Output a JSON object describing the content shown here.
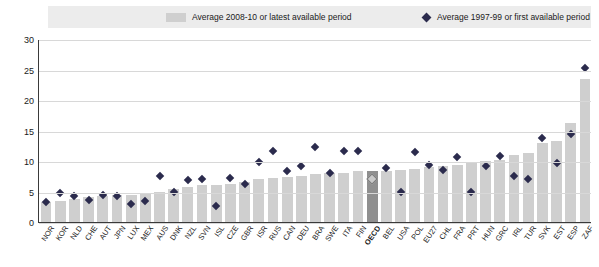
{
  "legend": {
    "bar_label": "Average 2008-10 or latest available period",
    "marker_label": "Average 1997-99 or first available period",
    "bar_color": "#cfcfcf",
    "marker_color": "#2b2b4d"
  },
  "chart_data": {
    "type": "bar",
    "title": "",
    "subtitle": "",
    "xlabel": "",
    "ylabel": "",
    "ylim": [
      0,
      30
    ],
    "yticks": [
      0,
      5,
      10,
      15,
      20,
      25,
      30
    ],
    "grid": true,
    "legend_position": "top",
    "highlight_category": "OECD",
    "categories": [
      "NOR",
      "KOR",
      "NLD",
      "CHE",
      "AUT",
      "JPN",
      "LUX",
      "MEX",
      "AUS",
      "DNK",
      "NZL",
      "SVN",
      "ISL",
      "CZE",
      "GBR",
      "ISR",
      "RUS",
      "CAN",
      "DEU",
      "BRA",
      "SWE",
      "ITA",
      "FIN",
      "OECD",
      "BEL",
      "USA",
      "POL",
      "EU27",
      "CHL",
      "FRA",
      "PRT",
      "HUN",
      "GRC",
      "IRL",
      "TUR",
      "SVK",
      "EST",
      "ESP",
      "ZAF"
    ],
    "series": [
      {
        "name": "Average 2008-10 or latest available period",
        "type": "bar",
        "color": "#cfcfcf",
        "values": [
          3.3,
          3.5,
          3.8,
          4.1,
          4.3,
          4.5,
          4.5,
          4.8,
          5.0,
          5.4,
          5.8,
          6.0,
          6.1,
          6.3,
          6.5,
          7.0,
          7.2,
          7.4,
          7.6,
          7.8,
          8.0,
          8.1,
          8.3,
          8.4,
          8.4,
          8.6,
          8.7,
          9.0,
          9.2,
          9.3,
          9.8,
          10.0,
          10.2,
          11.0,
          11.3,
          13.0,
          13.2,
          16.3,
          23.5
        ]
      },
      {
        "name": "Average 1997-99 or first available period",
        "type": "scatter",
        "marker": "diamond",
        "color": "#2b2b4d",
        "values": [
          3.3,
          4.8,
          4.2,
          3.6,
          4.4,
          4.2,
          2.9,
          3.4,
          7.6,
          5.0,
          6.9,
          7.0,
          2.7,
          7.2,
          6.3,
          9.9,
          11.7,
          8.4,
          9.2,
          12.3,
          8.1,
          11.6,
          11.6,
          7.1,
          8.9,
          4.9,
          11.4,
          9.4,
          8.6,
          10.6,
          4.9,
          9.2,
          10.9,
          7.5,
          7.0,
          13.7,
          9.7,
          14.4,
          25.2
        ]
      }
    ]
  }
}
